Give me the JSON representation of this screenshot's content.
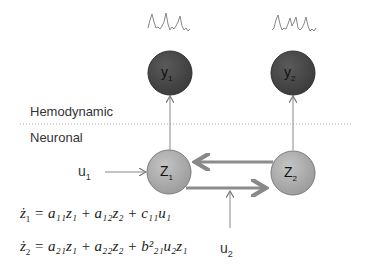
{
  "layers": {
    "top": "Hemodynamic",
    "bottom": "Neuronal"
  },
  "nodes": {
    "y1": {
      "label": "y",
      "sub": "1",
      "color": "#4a4a4a"
    },
    "y2": {
      "label": "y",
      "sub": "2",
      "color": "#4a4a4a"
    },
    "z1": {
      "label": "Z",
      "sub": "1",
      "color": "#a6a6a6"
    },
    "z2": {
      "label": "Z",
      "sub": "2",
      "color": "#a6a6a6"
    }
  },
  "inputs": {
    "u1": {
      "label": "u",
      "sub": "1"
    },
    "u2": {
      "label": "u",
      "sub": "2"
    }
  },
  "equations": [
    {
      "lhs": "ż",
      "lhs_sub": "1",
      "rhs": "= a₁₁z₁ + a₁₂z₂ + c₁₁u₁"
    },
    {
      "lhs": "ż",
      "lhs_sub": "2",
      "rhs": "= a₂₁z₁ + a₂₂z₂ + b²₂₁u₂z₁"
    }
  ]
}
